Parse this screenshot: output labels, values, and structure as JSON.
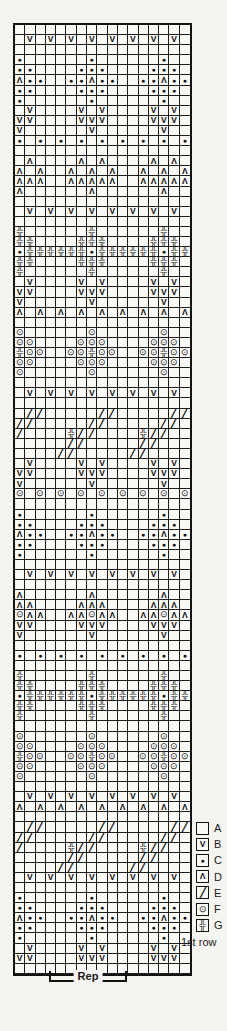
{
  "chart": {
    "columns": 17,
    "rows": 94,
    "grid_rows": [
      ".................",
      ".B.B.B.B.B.B.B.B.",
      ".................",
      "C......C......C..",
      "CC....CCC....CCC.",
      "DCC..CCDCC..CCDCC",
      "CC....CCC....CCC.",
      "C......C......C..",
      ".B....B.B....B.B.",
      "BB....BBB....BBB.",
      "B......B......B..",
      "C.C.C.C.C.C.C.C.C",
      ".................",
      ".D....D.D....D.D.",
      "D.D..D.D.D..D.D.D",
      "DDD..DDDDD..DDDDD",
      "D......D......D..",
      ".................",
      ".B.B.B.B.B.B.B.B.",
      ".................",
      "G......G......G..",
      "GG....GGG....GGG.",
      "CGGGGGGCGGGGGGCGG",
      "GG....GGG....GGG.",
      "G......G......G..",
      ".B....B.B....B.B.",
      "BB....BBB....BBB.",
      "B......B......B..",
      "D.D.D.D.D.D.D.D.D",
      ".................",
      "F......F......F..",
      "FF....FFF....FFF.",
      "GFF..FFGFF..FFGFF",
      "FF....FFF....FFF.",
      "F......F......F..",
      ".................",
      ".B.B.B.B.B.B.B.B.",
      ".................",
      ".EE.....EE.....EE",
      "EE.....EE.....EE.",
      "E....GEE....GEE..",
      ".....EE.....EE...",
      "....EE.....EE....",
      ".B....B.B....B.B.",
      "BB....BBB....BBB.",
      "B......B......B..",
      "F.F.F.F.F.F.F.F.F",
      ".................",
      "C......C......C..",
      "CC....CCC....CCC.",
      "DCC..CCDCC..CCDCC",
      "CC....CCC....CCC.",
      "C......C......C..",
      ".................",
      ".B.B.B.B.B.B.B.B.",
      ".................",
      "D......D......D..",
      "DD....DDD....DDD.",
      "FDD..DDFDD..DDFDD",
      "BB....BBB....BBB.",
      "B......B......B..",
      ".................",
      "C.C.C.C.C.C.C.C.C",
      ".................",
      "G......G......G..",
      "GG....GGG....GGG.",
      "CGGGGGGCGGGGGGCGG",
      "GG....GGG....GGG.",
      "G......G......G..",
      ".................",
      "F......F......F..",
      "FF....FFF....FFF.",
      "GFF..FFGFF..FFGFF",
      "FF....FFF....FFF.",
      "F......F......F..",
      ".................",
      ".B.B.B.B.B.B.B.B.",
      "D.D.D.D.D.D.D.D.D",
      ".................",
      ".EE.....EE.....EE",
      "EE.....EE.....EE.",
      "E....GEE....GEE..",
      ".....EE.....EE...",
      "....EE.....EE....",
      ".B.B.B.B.B.B.B.B.",
      ".................",
      "C......C......C..",
      "CC....CCC....CCC.",
      "DCC..CCDCC..CCDCC",
      "CC....CCC....CCC.",
      "C......C......C..",
      ".B....B.B....B.B.",
      "BB....BBB....BBB.",
      "................."
    ]
  },
  "symbols": {
    "A": "",
    "B": "V",
    "C": "●",
    "D": "Λ",
    "E": "╱",
    "F": "⊙",
    "G": "╬"
  },
  "legend": {
    "items": [
      {
        "letter": "A",
        "symbol": "A"
      },
      {
        "letter": "B",
        "symbol": "B"
      },
      {
        "letter": "C",
        "symbol": "C"
      },
      {
        "letter": "D",
        "symbol": "D"
      },
      {
        "letter": "E",
        "symbol": "E"
      },
      {
        "letter": "F",
        "symbol": "F"
      },
      {
        "letter": "G",
        "symbol": "G"
      }
    ]
  },
  "labels": {
    "first_row": "1st row",
    "rep": "Rep"
  },
  "colors": {
    "ink": "#131313",
    "paper": "#f4f4f1"
  }
}
